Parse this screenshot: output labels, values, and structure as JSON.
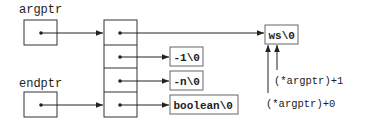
{
  "diagram": {
    "variables": [
      {
        "name": "argptr"
      },
      {
        "name": "endptr"
      }
    ],
    "array": {
      "cells": 4
    },
    "strings": [
      {
        "id": "ws",
        "label": "ws\\0"
      },
      {
        "id": "neg1",
        "label": "-1\\0"
      },
      {
        "id": "negn",
        "label": "-n\\0"
      },
      {
        "id": "boolean",
        "label": "boolean\\0"
      }
    ],
    "annotations": [
      {
        "id": "plus1",
        "text": "(*argptr)+1"
      },
      {
        "id": "plus0",
        "text": "(*argptr)+0"
      }
    ],
    "colors": {
      "line": "#222222",
      "box_border": "#333333",
      "string_box_border": "#666666",
      "background": "#ffffff"
    }
  }
}
